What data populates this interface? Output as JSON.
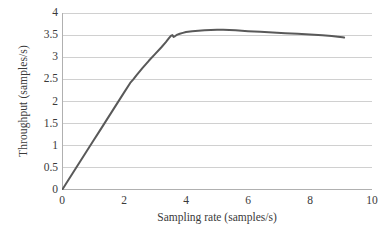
{
  "chart_data": {
    "type": "line",
    "title": "",
    "xlabel": "Sampling rate (samples/s)",
    "ylabel": "Throughput (samples/s)",
    "xlim": [
      0,
      10
    ],
    "ylim": [
      0,
      4
    ],
    "xticks": [
      0,
      2,
      4,
      6,
      8,
      10
    ],
    "yticks": [
      0,
      0.5,
      1,
      1.5,
      2,
      2.5,
      3,
      3.5,
      4
    ],
    "xtick_labels": [
      "0",
      "2",
      "4",
      "6",
      "8",
      "10"
    ],
    "ytick_labels": [
      "0",
      "0.5",
      "1",
      "1.5",
      "2",
      "2.5",
      "3",
      "3.5",
      "4"
    ],
    "grid": "horizontal",
    "legend": "none",
    "line_color": "#595959",
    "grid_color": "#d0d0d0",
    "axis_color": "#b0b0b0",
    "series": [
      {
        "name": "Throughput",
        "x": [
          0.0,
          0.2,
          0.4,
          0.6,
          0.8,
          1.0,
          1.2,
          1.4,
          1.6,
          1.8,
          2.0,
          2.2,
          2.3,
          2.4,
          2.6,
          2.8,
          3.0,
          3.2,
          3.35,
          3.45,
          3.52,
          3.56,
          3.6,
          3.65,
          3.72,
          3.8,
          3.9,
          4.0,
          4.2,
          4.4,
          4.6,
          4.8,
          5.0,
          5.2,
          5.4,
          5.6,
          5.8,
          6.0,
          6.4,
          6.8,
          7.2,
          7.6,
          8.0,
          8.4,
          8.7,
          8.9,
          9.05,
          9.1
        ],
        "y": [
          0.0,
          0.22,
          0.44,
          0.66,
          0.88,
          1.1,
          1.32,
          1.54,
          1.76,
          1.98,
          2.2,
          2.42,
          2.5,
          2.59,
          2.76,
          2.92,
          3.07,
          3.22,
          3.34,
          3.43,
          3.49,
          3.5,
          3.46,
          3.48,
          3.51,
          3.53,
          3.55,
          3.57,
          3.59,
          3.6,
          3.61,
          3.615,
          3.62,
          3.62,
          3.615,
          3.61,
          3.6,
          3.59,
          3.575,
          3.56,
          3.545,
          3.53,
          3.515,
          3.5,
          3.48,
          3.465,
          3.45,
          3.445
        ]
      }
    ],
    "annotations": []
  },
  "axes": {
    "y_title": "Throughput (samples/s)",
    "x_title": "Sampling rate (samples/s)"
  }
}
